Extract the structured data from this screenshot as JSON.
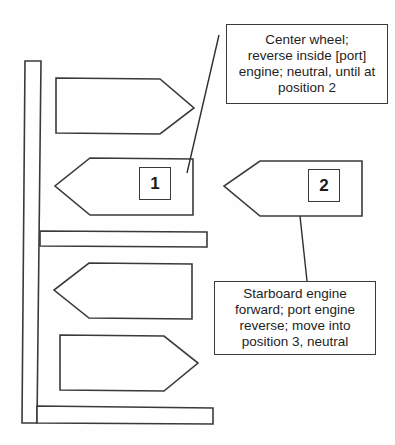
{
  "diagram": {
    "boats": [
      {
        "id": "boat-top-right-pointing",
        "direction": "right",
        "label": ""
      },
      {
        "id": "boat-1",
        "direction": "left",
        "label": "1"
      },
      {
        "id": "boat-2",
        "direction": "left",
        "label": "2"
      },
      {
        "id": "boat-lower-left-pointing",
        "direction": "left",
        "label": ""
      },
      {
        "id": "boat-bottom-right-pointing",
        "direction": "right",
        "label": ""
      }
    ],
    "callouts": [
      {
        "id": "callout-position-1",
        "points_to": "boat-1",
        "lines": [
          "Center wheel;",
          "reverse inside [port]",
          "engine; neutral, until at",
          "position 2"
        ]
      },
      {
        "id": "callout-position-2",
        "points_to": "boat-2",
        "lines": [
          "Starboard engine",
          "forward; port engine",
          "reverse; move into",
          "position 3, neutral"
        ]
      }
    ],
    "colors": {
      "stroke": "#3a3a3a",
      "fill": "#ffffff",
      "text": "#1e1e1e"
    }
  }
}
